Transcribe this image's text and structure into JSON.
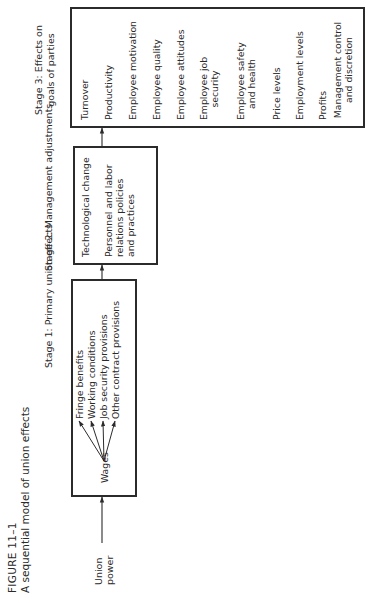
{
  "figure": {
    "number": "FIGURE 11–1",
    "title": "A sequential model of union effects"
  },
  "input": {
    "label_line1": "Union",
    "label_line2": "power"
  },
  "stage1": {
    "heading": "Stage 1: Primary union effects",
    "source": "Wages",
    "effects": [
      "Fringe benefits",
      "Working conditions",
      "Job security provisions",
      "Other contract provisions"
    ]
  },
  "stage2": {
    "heading": "Stage 2: Management adjustments",
    "items": [
      {
        "lines": [
          "Technological change"
        ]
      },
      {
        "lines": [
          "Personnel and labor",
          "relations policies",
          "and practices"
        ]
      }
    ]
  },
  "stage3": {
    "heading_line1": "Stage 3: Effects on",
    "heading_line2": "goals of parties",
    "items": [
      {
        "lines": [
          "Turnover"
        ]
      },
      {
        "lines": [
          "Productivity"
        ]
      },
      {
        "lines": [
          "Employee motivation"
        ]
      },
      {
        "lines": [
          "Employee quality"
        ]
      },
      {
        "lines": [
          "Employee attitudes"
        ]
      },
      {
        "lines": [
          "Employee job",
          "security"
        ]
      },
      {
        "lines": [
          "Employee safety",
          "and health"
        ]
      },
      {
        "lines": [
          "Price levels"
        ]
      },
      {
        "lines": [
          "Employment levels"
        ]
      },
      {
        "lines": [
          "Profits"
        ]
      },
      {
        "lines": [
          "Management control",
          "and discretion"
        ]
      }
    ]
  },
  "colors": {
    "ink": "#2b2b2b",
    "background": "#ffffff"
  }
}
